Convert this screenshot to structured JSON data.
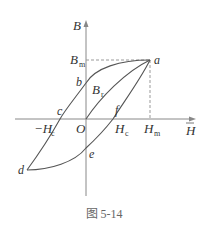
{
  "figure": {
    "caption": "图 5-14",
    "axes": {
      "y_label": "B",
      "x_label": "H"
    },
    "labels": {
      "Bm_main": "B",
      "Bm_sub": "m",
      "Br_main": "B",
      "Br_sub": "r",
      "negHc_main": "−H",
      "negHc_sub": "c",
      "Hc_main": "H",
      "Hc_sub": "c",
      "Hm_main": "H",
      "Hm_sub": "m",
      "origin": "O",
      "a": "a",
      "b": "b",
      "c": "c",
      "d": "d",
      "e": "e",
      "f": "f"
    },
    "colors": {
      "curve": "#555555",
      "axis": "#888888",
      "dashed": "#999999"
    }
  }
}
